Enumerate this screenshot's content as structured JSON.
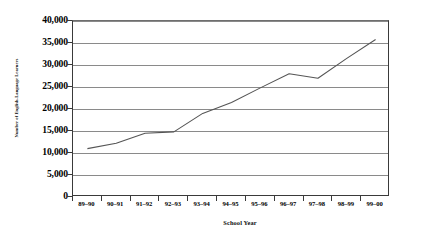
{
  "chart_data": {
    "type": "line",
    "title": "",
    "xlabel": "School Year",
    "ylabel": "Number of English-Language Learners",
    "categories": [
      "89–90",
      "90–91",
      "91–92",
      "92–93",
      "93–94",
      "94–95",
      "95–96",
      "96–97",
      "97–98",
      "98–99",
      "99–00"
    ],
    "series": [
      {
        "name": "English-Language Learners",
        "values": [
          11000,
          12200,
          14500,
          14800,
          19000,
          21500,
          24800,
          28000,
          27000,
          31500,
          35800
        ]
      }
    ],
    "ylim": [
      0,
      40000
    ],
    "ytick_labels": [
      "40,000",
      "35,000",
      "30,000",
      "25,000",
      "20,000",
      "15,000",
      "10,000",
      "5,000",
      "0"
    ],
    "ytick_values": [
      40000,
      35000,
      30000,
      25000,
      20000,
      15000,
      10000,
      5000,
      0
    ],
    "grid": "horizontal",
    "legend": "none",
    "line_color": "#555555",
    "grid_color": "#8a8a8a",
    "axis_color": "#3a3a3a"
  },
  "caption": {
    "sliver_text": ""
  }
}
